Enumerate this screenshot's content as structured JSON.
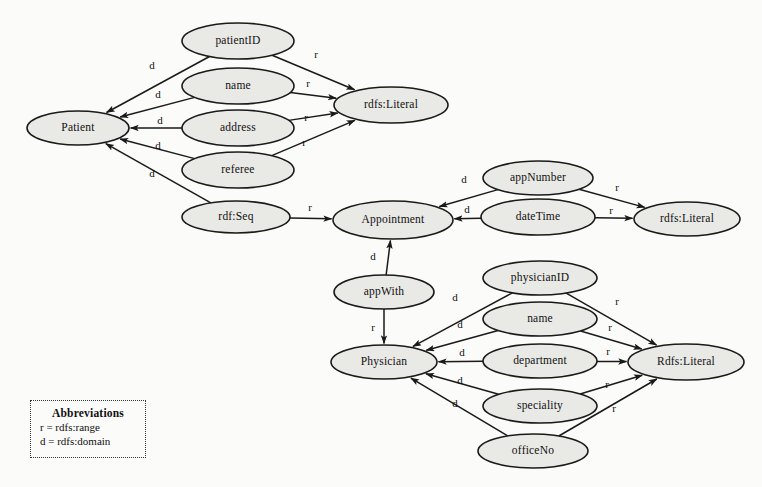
{
  "diagram": {
    "background_color": "#fbfbfa",
    "node_fill_color": "#e9e9e6",
    "stroke_color": "#1a1a1a"
  },
  "nodes": [
    {
      "id": "patient",
      "label": "Patient",
      "cx": 78,
      "cy": 128,
      "rx": 51,
      "ry": 17
    },
    {
      "id": "patientID",
      "label": "patientID",
      "cx": 238,
      "cy": 41,
      "rx": 56,
      "ry": 18
    },
    {
      "id": "name1",
      "label": "name",
      "cx": 238,
      "cy": 86,
      "rx": 56,
      "ry": 18
    },
    {
      "id": "address",
      "label": "address",
      "cx": 238,
      "cy": 128,
      "rx": 56,
      "ry": 18
    },
    {
      "id": "referee",
      "label": "referee",
      "cx": 238,
      "cy": 170,
      "rx": 56,
      "ry": 18
    },
    {
      "id": "rdfSeq",
      "label": "rdf:Seq",
      "cx": 236,
      "cy": 217,
      "rx": 54,
      "ry": 16
    },
    {
      "id": "literalTop",
      "label": "rdfs:Literal",
      "cx": 391,
      "cy": 105,
      "rx": 57,
      "ry": 18
    },
    {
      "id": "appointment",
      "label": "Appointment",
      "cx": 393,
      "cy": 220,
      "rx": 60,
      "ry": 19
    },
    {
      "id": "appNumber",
      "label": "appNumber",
      "cx": 538,
      "cy": 178,
      "rx": 55,
      "ry": 17
    },
    {
      "id": "dateTime",
      "label": "dateTime",
      "cx": 538,
      "cy": 217,
      "rx": 57,
      "ry": 18
    },
    {
      "id": "literalMid",
      "label": "rdfs:Literal",
      "cx": 687,
      "cy": 219,
      "rx": 53,
      "ry": 17
    },
    {
      "id": "appWith",
      "label": "appWith",
      "cx": 384,
      "cy": 292,
      "rx": 50,
      "ry": 17
    },
    {
      "id": "physician",
      "label": "Physician",
      "cx": 384,
      "cy": 362,
      "rx": 53,
      "ry": 17
    },
    {
      "id": "physicianID",
      "label": "physicianID",
      "cx": 540,
      "cy": 278,
      "rx": 57,
      "ry": 17
    },
    {
      "id": "name2",
      "label": "name",
      "cx": 540,
      "cy": 319,
      "rx": 57,
      "ry": 17
    },
    {
      "id": "department",
      "label": "department",
      "cx": 540,
      "cy": 361,
      "rx": 57,
      "ry": 17
    },
    {
      "id": "speciality",
      "label": "speciality",
      "cx": 540,
      "cy": 406,
      "rx": 57,
      "ry": 17
    },
    {
      "id": "officeNo",
      "label": "officeNo",
      "cx": 533,
      "cy": 451,
      "rx": 55,
      "ry": 17
    },
    {
      "id": "literalBot",
      "label": "Rdfs:Literal",
      "cx": 686,
      "cy": 362,
      "rx": 58,
      "ry": 18
    }
  ],
  "edges": [
    {
      "id": "e-patientID-d",
      "from": "patientID",
      "to": "patient",
      "label": "d",
      "lx": 152,
      "ly": 66
    },
    {
      "id": "e-name1-d",
      "from": "name1",
      "to": "patient",
      "label": "d",
      "lx": 158,
      "ly": 95
    },
    {
      "id": "e-address-d",
      "from": "address",
      "to": "patient",
      "label": "d",
      "lx": 160,
      "ly": 121
    },
    {
      "id": "e-referee-d",
      "from": "referee",
      "to": "patient",
      "label": "d",
      "lx": 158,
      "ly": 146
    },
    {
      "id": "e-rdfSeq-d",
      "from": "rdfSeq",
      "to": "patient",
      "label": "d",
      "lx": 152,
      "ly": 174
    },
    {
      "id": "e-patientID-r",
      "from": "patientID",
      "to": "literalTop",
      "label": "r",
      "lx": 316,
      "ly": 55
    },
    {
      "id": "e-name1-r",
      "from": "name1",
      "to": "literalTop",
      "label": "r",
      "lx": 308,
      "ly": 84
    },
    {
      "id": "e-address-r",
      "from": "address",
      "to": "literalTop",
      "label": "r",
      "lx": 306,
      "ly": 118
    },
    {
      "id": "e-referee-r",
      "from": "referee",
      "to": "literalTop",
      "label": "r",
      "lx": 304,
      "ly": 143
    },
    {
      "id": "e-rdfSeq-r",
      "from": "rdfSeq",
      "to": "appointment",
      "label": "r",
      "lx": 310,
      "ly": 208
    },
    {
      "id": "e-appNumber-d",
      "from": "appNumber",
      "to": "appointment",
      "label": "d",
      "lx": 464,
      "ly": 180
    },
    {
      "id": "e-dateTime-d",
      "from": "dateTime",
      "to": "appointment",
      "label": "d",
      "lx": 467,
      "ly": 210
    },
    {
      "id": "e-appNumber-r",
      "from": "appNumber",
      "to": "literalMid",
      "label": "r",
      "lx": 617,
      "ly": 188
    },
    {
      "id": "e-dateTime-r",
      "from": "dateTime",
      "to": "literalMid",
      "label": "r",
      "lx": 611,
      "ly": 211
    },
    {
      "id": "e-appWith-d",
      "from": "appWith",
      "to": "appointment",
      "label": "d",
      "lx": 373,
      "ly": 257
    },
    {
      "id": "e-appWith-r",
      "from": "appWith",
      "to": "physician",
      "label": "r",
      "lx": 373,
      "ly": 328
    },
    {
      "id": "e-physicianID-d",
      "from": "physicianID",
      "to": "physician",
      "label": "d",
      "lx": 455,
      "ly": 298
    },
    {
      "id": "e-name2-d",
      "from": "name2",
      "to": "physician",
      "label": "d",
      "lx": 460,
      "ly": 325
    },
    {
      "id": "e-department-d",
      "from": "department",
      "to": "physician",
      "label": "d",
      "lx": 462,
      "ly": 353
    },
    {
      "id": "e-speciality-d",
      "from": "speciality",
      "to": "physician",
      "label": "d",
      "lx": 460,
      "ly": 381
    },
    {
      "id": "e-officeNo-d",
      "from": "officeNo",
      "to": "physician",
      "label": "d",
      "lx": 455,
      "ly": 404
    },
    {
      "id": "e-physicianID-r",
      "from": "physicianID",
      "to": "literalBot",
      "label": "r",
      "lx": 617,
      "ly": 302
    },
    {
      "id": "e-name2-r",
      "from": "name2",
      "to": "literalBot",
      "label": "r",
      "lx": 610,
      "ly": 328
    },
    {
      "id": "e-department-r",
      "from": "department",
      "to": "literalBot",
      "label": "r",
      "lx": 608,
      "ly": 352
    },
    {
      "id": "e-speciality-r",
      "from": "speciality",
      "to": "literalBot",
      "label": "r",
      "lx": 607,
      "ly": 385
    },
    {
      "id": "e-officeNo-r",
      "from": "officeNo",
      "to": "literalBot",
      "label": "r",
      "lx": 614,
      "ly": 409
    }
  ],
  "legend": {
    "title": "Abbreviations",
    "lines": [
      "r = rdfs:range",
      "d = rdfs:domain"
    ],
    "x": 30,
    "y": 400,
    "width": 116,
    "height": 58
  }
}
